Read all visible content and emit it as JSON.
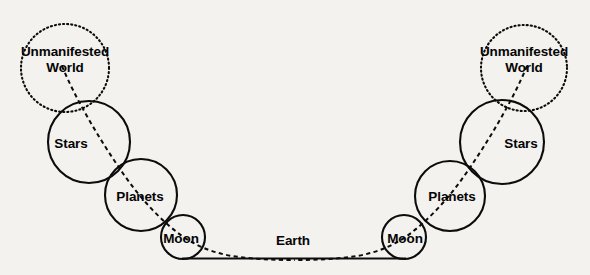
{
  "diagram": {
    "type": "concentric-spheres-cosmology-diagram",
    "background_color": "#f3f2ee",
    "stroke_color": "#0c0c0c",
    "labels": {
      "unmanifested_world_line1": "Unmanifested",
      "unmanifested_world_line2": "World",
      "stars": "Stars",
      "planets": "Planets",
      "moon": "Moon",
      "earth": "Earth"
    },
    "left_branch": {
      "unmanifested_world": {
        "cx": 65,
        "cy": 68,
        "r": 44,
        "style": "dotted"
      },
      "stars": {
        "cx": 89,
        "cy": 142,
        "r": 41,
        "style": "solid"
      },
      "planets": {
        "cx": 141,
        "cy": 195,
        "r": 36,
        "style": "solid"
      },
      "moon": {
        "cx": 183,
        "cy": 237,
        "r": 22,
        "style": "solid"
      }
    },
    "right_branch": {
      "unmanifested_world": {
        "cx": 524,
        "cy": 68,
        "r": 43,
        "style": "dotted"
      },
      "stars": {
        "cx": 502,
        "cy": 142,
        "r": 42,
        "style": "solid"
      },
      "planets": {
        "cx": 450,
        "cy": 196,
        "r": 35,
        "style": "solid"
      },
      "moon": {
        "cx": 404,
        "cy": 237,
        "r": 22,
        "style": "solid"
      }
    },
    "earth_line": {
      "x1": 182,
      "y1": 258,
      "x2": 406,
      "y2": 258,
      "style": "solid"
    },
    "trajectory": {
      "style": "dashed",
      "description": "dashed arc from left Unmanifested World through Stars, Planets, Moon, along Earth, and symmetrically up the right branch"
    }
  }
}
